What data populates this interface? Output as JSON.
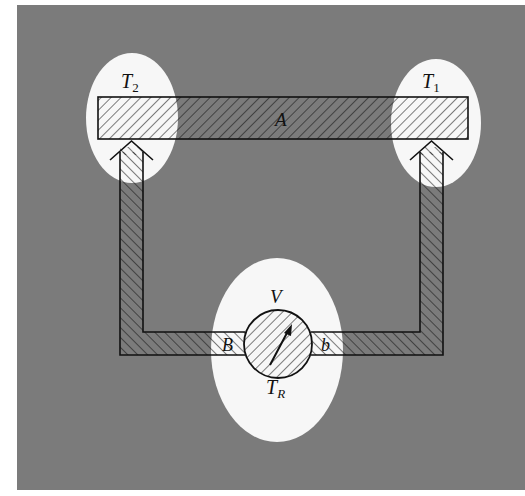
{
  "figure": {
    "type": "thermocouple-circuit-diagram",
    "background_color": "#7a7a7a",
    "highlight_color": "#f7f7f7",
    "line_color": "#111111"
  },
  "labels": {
    "hot_junction": {
      "text": "T",
      "subscript": "2"
    },
    "cold_junction": {
      "text": "T",
      "subscript": "1"
    },
    "material_a": "A",
    "material_b_left": "B",
    "material_b_right": "b",
    "voltmeter": "V",
    "reference_temp": {
      "text": "T",
      "subscript": "R"
    }
  },
  "components": {
    "bar": {
      "name": "conductor A"
    },
    "left_lead": {
      "name": "lead B (left)"
    },
    "right_lead": {
      "name": "lead b (right)"
    },
    "meter": {
      "name": "voltmeter V"
    }
  }
}
